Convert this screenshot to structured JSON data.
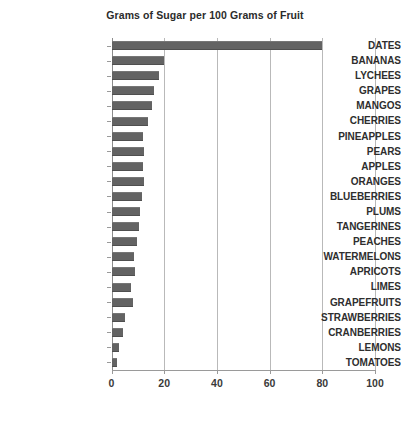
{
  "chart_data": {
    "type": "bar",
    "orientation": "horizontal",
    "title": "Grams of Sugar per 100 Grams of Fruit",
    "xlabel": "",
    "ylabel": "",
    "xlim": [
      0,
      100
    ],
    "xticks": [
      0,
      20,
      40,
      60,
      80,
      100
    ],
    "xtick_labels": [
      "0",
      "20",
      "40",
      "60",
      "80",
      "100"
    ],
    "grid": "vertical",
    "legend": "none",
    "bar_color": "#636363",
    "gridline_color": "#b9b9b9",
    "categories": [
      "DATES",
      "BANANAS",
      "LYCHEES",
      "GRAPES",
      "MANGOS",
      "CHERRIES",
      "PINEAPPLES",
      "PEARS",
      "APPLES",
      "ORANGES",
      "BLUEBERRIES",
      "PLUMS",
      "TANGERINES",
      "PEACHES",
      "WATERMELONS",
      "APRICOTS",
      "LIMES",
      "GRAPEFRUITS",
      "STRAWBERRIES",
      "CRANBERRIES",
      "LEMONS",
      "TOMATOES"
    ],
    "values": [
      80.0,
      20.0,
      18.0,
      16.0,
      15.5,
      14.0,
      12.0,
      12.5,
      12.0,
      12.5,
      11.5,
      11.0,
      10.5,
      9.5,
      8.5,
      9.0,
      7.5,
      8.0,
      5.0,
      4.5,
      3.0,
      2.0
    ]
  }
}
